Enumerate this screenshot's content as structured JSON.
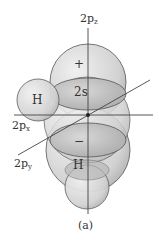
{
  "figure": {
    "caption": "(a)",
    "axes": {
      "z_label": "2p",
      "z_sub": "z",
      "x_label": "2p",
      "x_sub": "x",
      "y_label": "2p",
      "y_sub": "y"
    },
    "lobes": {
      "upper_sign": "+",
      "lower_sign": "−",
      "s_orbital": "2s"
    },
    "atoms": {
      "h_left": "H",
      "h_bottom": "H"
    },
    "colors": {
      "lobe_fill": "#e6e6e6",
      "lobe_dark": "#bdbdbd",
      "outline": "#555555",
      "axis": "#444444",
      "text": "#333333"
    }
  }
}
